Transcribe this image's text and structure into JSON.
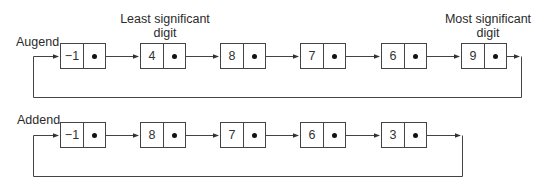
{
  "labels": {
    "augend": "Augend",
    "addend": "Addend",
    "least_significant_line1": "Least significant",
    "least_significant_line2": "digit",
    "most_significant_line1": "Most significant",
    "most_significant_line2": "digit"
  },
  "augend_list": {
    "values": [
      "−1",
      "4",
      "8",
      "7",
      "6",
      "9"
    ]
  },
  "addend_list": {
    "values": [
      "−1",
      "8",
      "7",
      "6",
      "3"
    ]
  },
  "colors": {
    "line": "#444444",
    "text": "#2a2a2a"
  }
}
